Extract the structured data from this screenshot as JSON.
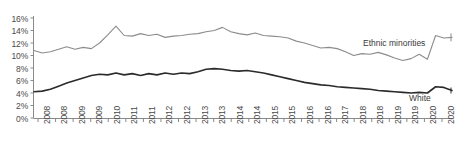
{
  "chart_data": {
    "type": "line",
    "title": "",
    "subtitle": "",
    "xlabel": "",
    "ylabel": "",
    "ylim": [
      0,
      16
    ],
    "ytick_labels": [
      "16%",
      "14%",
      "12%",
      "10%",
      "8%",
      "6%",
      "4%",
      "2%",
      "0%"
    ],
    "ytick_values": [
      16,
      14,
      12,
      10,
      8,
      6,
      4,
      2,
      0
    ],
    "grid": false,
    "legend_position": "inline-right",
    "x_tick_labels": [
      "2008",
      "2008",
      "2009",
      "2009",
      "2010",
      "2011",
      "2011",
      "2012",
      "2012",
      "2013",
      "2013",
      "2014",
      "2014",
      "2015",
      "2015",
      "2016",
      "2016",
      "2017",
      "2018",
      "2018",
      "2019",
      "2019",
      "2020",
      "2020"
    ],
    "x_start": "2008 Q1",
    "x_end": "2020 Q4",
    "n_points": 52,
    "series": [
      {
        "name": "Ethnic minorities",
        "color": "#8c8c8c",
        "label_text": "Ethnic minorities",
        "values": [
          10.8,
          10.4,
          10.6,
          11.0,
          11.4,
          11.0,
          11.3,
          11.1,
          12.0,
          13.3,
          14.7,
          13.2,
          13.1,
          13.5,
          13.2,
          13.4,
          12.9,
          13.1,
          13.2,
          13.4,
          13.5,
          13.8,
          14.0,
          14.5,
          13.8,
          13.5,
          13.3,
          13.6,
          13.2,
          13.1,
          13.0,
          12.8,
          12.3,
          12.0,
          11.6,
          11.2,
          11.3,
          11.1,
          10.6,
          10.0,
          10.3,
          10.2,
          10.5,
          10.1,
          9.6,
          9.2,
          9.5,
          10.2,
          9.4,
          13.2,
          12.8,
          12.9
        ]
      },
      {
        "name": "White",
        "color": "#2b2b2b",
        "label_text": "White",
        "values": [
          4.2,
          4.3,
          4.6,
          5.1,
          5.6,
          6.0,
          6.4,
          6.8,
          7.0,
          6.9,
          7.2,
          6.9,
          7.1,
          6.8,
          7.1,
          6.9,
          7.2,
          7.0,
          7.2,
          7.1,
          7.4,
          7.8,
          7.9,
          7.8,
          7.6,
          7.5,
          7.6,
          7.4,
          7.2,
          6.9,
          6.6,
          6.3,
          6.0,
          5.7,
          5.5,
          5.3,
          5.2,
          5.0,
          4.9,
          4.8,
          4.7,
          4.6,
          4.4,
          4.3,
          4.2,
          4.1,
          4.0,
          4.1,
          4.0,
          5.0,
          4.9,
          4.4
        ]
      }
    ]
  }
}
